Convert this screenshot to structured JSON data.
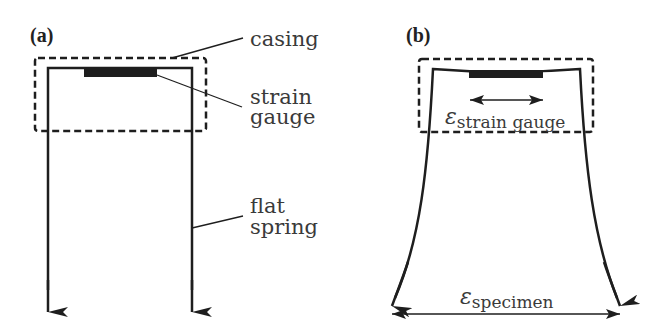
{
  "panels": {
    "a": {
      "label": "(a)",
      "annotations": {
        "casing": "casing",
        "strain_gauge_line1": "strain",
        "strain_gauge_line2": "gauge",
        "flat_spring_line1": "flat",
        "flat_spring_line2": "spring"
      }
    },
    "b": {
      "label": "(b)",
      "symbols": {
        "epsilon": "ε",
        "strain_gauge_sub": "strain gauge",
        "specimen_sub": "specimen"
      }
    }
  },
  "colors": {
    "stroke": "#1e1e1e",
    "text": "#3a3a3a",
    "background": "#ffffff"
  }
}
